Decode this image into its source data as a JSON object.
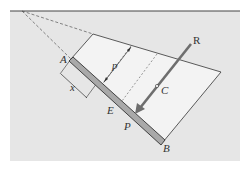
{
  "diagram": {
    "title": "",
    "colors": {
      "background": "#e6e6e6",
      "plate": "#f2f2f2",
      "line": "#333333",
      "bar_fill": "#a9a9a9",
      "force": "#6e6e6e"
    },
    "labels": {
      "A": "A",
      "B": "B",
      "C": "C",
      "E": "E",
      "P": "P",
      "R": "R",
      "p": "p",
      "x": "x"
    }
  }
}
